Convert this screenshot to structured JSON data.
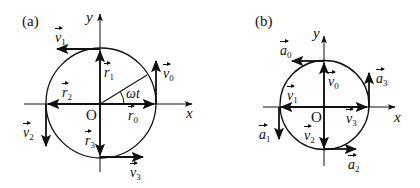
{
  "diagram_a": {
    "panel_label": "(a)",
    "x_axis_label": "x",
    "y_axis_label": "y",
    "origin_label": "O",
    "angle_label": "ωt",
    "vectors": [
      {
        "symbol": "v",
        "sub": "1"
      },
      {
        "symbol": "r",
        "sub": "1"
      },
      {
        "symbol": "v",
        "sub": "0"
      },
      {
        "symbol": "r",
        "sub": "2"
      },
      {
        "symbol": "r",
        "sub": "0"
      },
      {
        "symbol": "v",
        "sub": "2"
      },
      {
        "symbol": "r",
        "sub": "3"
      },
      {
        "symbol": "v",
        "sub": "3"
      }
    ]
  },
  "diagram_b": {
    "panel_label": "(b)",
    "x_axis_label": "x",
    "y_axis_label": "y",
    "origin_label": "O",
    "vectors": [
      {
        "symbol": "a",
        "sub": "0"
      },
      {
        "symbol": "v",
        "sub": "0"
      },
      {
        "symbol": "a",
        "sub": "3"
      },
      {
        "symbol": "v",
        "sub": "1"
      },
      {
        "symbol": "v",
        "sub": "3"
      },
      {
        "symbol": "a",
        "sub": "1"
      },
      {
        "symbol": "v",
        "sub": "2"
      },
      {
        "symbol": "a",
        "sub": "2"
      }
    ]
  }
}
